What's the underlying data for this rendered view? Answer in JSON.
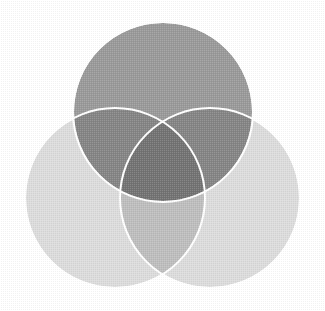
{
  "figure": {
    "name": "three-set-venn-diagram",
    "type": "venn",
    "width": 325,
    "height": 311,
    "background_color": "#ffffff",
    "title": "",
    "caption": "",
    "labels_visible": false,
    "texture": "dithered-halftone",
    "stroke": {
      "color": "#ffffff",
      "width": 2.0,
      "visible": true
    }
  },
  "chart_data": {
    "type": "venn",
    "title": "",
    "xlabel": "",
    "ylabel": "",
    "legend_position": "none",
    "grid": false,
    "sets": [
      {
        "id": "set-top",
        "name": "top-circle",
        "label": "",
        "cx": 163,
        "cy": 112,
        "r": 90,
        "fill": "#9a9a9a",
        "opacity": 1.0,
        "position": "top-center"
      },
      {
        "id": "set-bottom-left",
        "name": "bottom-left-circle",
        "label": "",
        "cx": 115,
        "cy": 198,
        "r": 90,
        "fill": "#dcdcdc",
        "opacity": 1.0,
        "position": "bottom-left"
      },
      {
        "id": "set-bottom-right",
        "name": "bottom-right-circle",
        "label": "",
        "cx": 210,
        "cy": 198,
        "r": 90,
        "fill": "#dcdcdc",
        "opacity": 1.0,
        "position": "bottom-right"
      }
    ],
    "region_shades": {
      "top_only": "#9a9a9a",
      "bottom_left_only": "#dcdcdc",
      "bottom_right_only": "#dcdcdc",
      "top_and_bottom_left": "#8d8d8d",
      "top_and_bottom_right": "#8d8d8d",
      "bottom_left_and_bottom_right": "#c6c6c6",
      "all_three": "#8a8a8a"
    },
    "values": [],
    "categories": []
  }
}
